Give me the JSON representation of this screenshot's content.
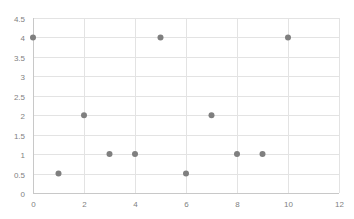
{
  "chart_data": {
    "type": "scatter",
    "title": "",
    "xlabel": "",
    "ylabel": "",
    "xlim": [
      0,
      12
    ],
    "ylim": [
      0,
      4.5
    ],
    "xticks": [
      0,
      2,
      4,
      6,
      8,
      10,
      12
    ],
    "yticks": [
      0,
      0.5,
      1,
      1.5,
      2,
      2.5,
      3,
      3.5,
      4,
      4.5
    ],
    "xtick_labels": [
      "0",
      "2",
      "4",
      "6",
      "8",
      "10",
      "12"
    ],
    "ytick_labels": [
      "0",
      "0.5",
      "1",
      "1.5",
      "2",
      "2.5",
      "3",
      "3.5",
      "4",
      "4.5"
    ],
    "grid": true,
    "legend": null,
    "series": [
      {
        "name": "Series1",
        "color": "#7f7f7f",
        "points": [
          {
            "x": 0,
            "y": 4
          },
          {
            "x": 1,
            "y": 0.5
          },
          {
            "x": 2,
            "y": 2
          },
          {
            "x": 3,
            "y": 1
          },
          {
            "x": 4,
            "y": 1
          },
          {
            "x": 5,
            "y": 4
          },
          {
            "x": 6,
            "y": 0.5
          },
          {
            "x": 7,
            "y": 2
          },
          {
            "x": 8,
            "y": 1
          },
          {
            "x": 9,
            "y": 1
          },
          {
            "x": 10,
            "y": 4
          }
        ]
      }
    ]
  },
  "colors": {
    "gridline": "#e3e3e3",
    "axis": "#c8c8c8",
    "marker": "#7f7f7f",
    "tick_label": "#7f7f7f"
  }
}
